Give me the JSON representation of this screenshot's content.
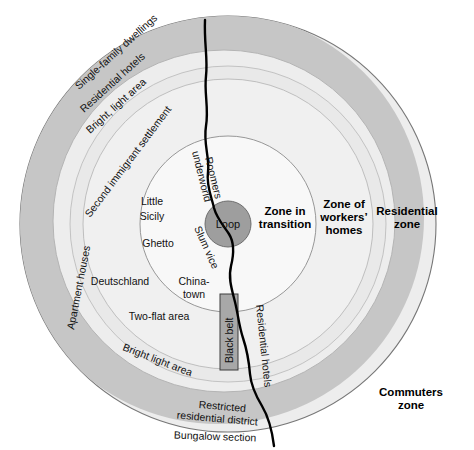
{
  "figure": {
    "type": "concentric-zone-diagram",
    "center": {
      "x": 228,
      "y": 224
    },
    "background_color": "#ffffff"
  },
  "rings": [
    {
      "id": "loop",
      "name": "Loop",
      "label": "Loop",
      "radius": 23,
      "fill": "#9e9e9e",
      "stroke": "#6e6e6e"
    },
    {
      "id": "zone-in-transition",
      "name": "Zone in transition",
      "label": "Zone in\ntransition",
      "radius": 88,
      "fill": "#f7f7f7",
      "stroke": "#808080"
    },
    {
      "id": "zone-of-workers-homes",
      "name": "Zone of workers' homes",
      "label": "Zone of\nworkers’\nhomes",
      "radius": 145,
      "fill": "#efefef",
      "stroke": "#b0b0b0"
    },
    {
      "id": "residential-zone",
      "name": "Residential zone",
      "label": "Residential\nzone",
      "radius": 158,
      "fill": "#e8e8e8",
      "stroke": "#bcbcbc"
    },
    {
      "id": "commuters-zone",
      "name": "Commuters zone",
      "label": "Commuters\nzone",
      "radius": 208,
      "fill": "#ededed",
      "stroke": "#8a8a8a"
    }
  ],
  "zone_labels": [
    {
      "id": "loop",
      "text": "Loop",
      "x": 228,
      "y": 228,
      "bold": false,
      "size": 11
    },
    {
      "id": "zone-in-transition",
      "line1": "Zone in",
      "line2": "transition",
      "x": 285,
      "y": 219
    },
    {
      "id": "zone-of-workers",
      "line1": "Zone of",
      "line2": "workers’",
      "line3": "homes",
      "x": 344,
      "y": 212
    },
    {
      "id": "residential-zone",
      "line1": "Residential",
      "line2": "zone",
      "x": 407,
      "y": 219
    },
    {
      "id": "commuters-zone",
      "line1": "Commuters",
      "line2": "zone",
      "x": 411,
      "y": 399
    }
  ],
  "curved_labels": [
    {
      "id": "single-family-dwellings",
      "text": "Single-family dwellings",
      "x": 79,
      "y": 90,
      "rotate": -42
    },
    {
      "id": "residential-hotels-outer",
      "text": "Residential hotels",
      "x": 82,
      "y": 112,
      "rotate": -42
    },
    {
      "id": "bright-light-area-upper",
      "text": "Bright, light area",
      "x": 88,
      "y": 132,
      "rotate": -42
    },
    {
      "id": "second-immigrant-settlement",
      "text": "Second immigrant settlement",
      "x": 112,
      "y": 148,
      "rotate": -52
    },
    {
      "id": "apartment-houses",
      "text": "Apartment houses",
      "x": 69,
      "y": 272,
      "rotate": -80
    },
    {
      "id": "bright-light-area-lower",
      "text": "Bright light area",
      "x": 164,
      "y": 363,
      "rotate": 20
    },
    {
      "id": "restricted-residential-district-l1",
      "text": "Restricted",
      "x": 222,
      "y": 410,
      "rotate": 8
    },
    {
      "id": "restricted-residential-district-l2",
      "text": "residential district",
      "x": 218,
      "y": 422,
      "rotate": 8
    },
    {
      "id": "bungalow-section",
      "text": "Bungalow section",
      "x": 218,
      "y": 440,
      "rotate": 4
    },
    {
      "id": "residential-hotels-inner",
      "text": "Residential hotels",
      "x": 258,
      "y": 350,
      "rotate": 84
    },
    {
      "id": "black-belt",
      "text": "Black belt",
      "x": 229,
      "y": 332,
      "rotate": -90
    },
    {
      "id": "roomers",
      "text": "Roomers",
      "x": 208,
      "y": 182,
      "rotate": 78
    },
    {
      "id": "underworld",
      "text": "underworld",
      "x": 196,
      "y": 180,
      "rotate": 78
    },
    {
      "id": "slum-vice",
      "text": "Slum vice",
      "x": 199,
      "y": 248,
      "rotate": 64
    }
  ],
  "inner_labels": [
    {
      "id": "little-sicily-l1",
      "text": "Little",
      "x": 152,
      "y": 205
    },
    {
      "id": "little-sicily-l2",
      "text": "Sicily",
      "x": 152,
      "y": 220
    },
    {
      "id": "ghetto",
      "text": "Ghetto",
      "x": 158,
      "y": 247
    },
    {
      "id": "chinatown-l1",
      "text": "China-",
      "x": 193,
      "y": 285
    },
    {
      "id": "chinatown-l2",
      "text": "town",
      "x": 193,
      "y": 298
    },
    {
      "id": "deutschland",
      "text": "Deutschland",
      "x": 120,
      "y": 285
    },
    {
      "id": "two-flat-area",
      "text": "Two-flat area",
      "x": 159,
      "y": 320
    }
  ],
  "black_belt_rect": {
    "name": "black-belt-strip",
    "x": 220,
    "y": 294,
    "width": 18,
    "height": 76,
    "fill": "#a8a8a8",
    "stroke": "#3a3a3a"
  },
  "shoreline": {
    "name": "lake-michigan-shoreline",
    "color": "#000000",
    "width": 2.4,
    "path": "M 205 20 C 204 44, 208 58, 206 76 C 204 94, 209 108, 206 126 C 203 144, 210 158, 208 172 C 206 186, 212 198, 214 208 C 217 219, 224 226, 229 234 C 234 242, 234 254, 231 266 C 228 278, 232 290, 235 302 C 238 314, 239 326, 243 338 C 247 350, 249 362, 250 374 C 251 386, 256 396, 262 406 C 268 416, 272 430, 274 446"
  },
  "accent_colors": {
    "outer_ring": "#c9c9c9",
    "mid_ring": "#e0e0e0",
    "inner_ring": "#f8f8f8",
    "loop": "#9e9e9e",
    "line": "#000000"
  }
}
